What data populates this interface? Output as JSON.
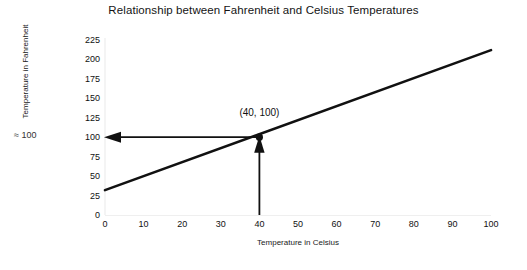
{
  "chart_data": {
    "type": "line",
    "title": "Relationship between Fahrenheit and Celsius Temperatures",
    "xlabel": "Temperature in Celsius",
    "ylabel": "Temperature in Fahrenheit",
    "xlim": [
      0,
      100
    ],
    "ylim": [
      0,
      225
    ],
    "grid": false,
    "legend": false,
    "xticks": [
      "0",
      "10",
      "20",
      "30",
      "40",
      "50",
      "60",
      "70",
      "80",
      "90",
      "100"
    ],
    "xtick_values": [
      0,
      10,
      20,
      30,
      40,
      50,
      60,
      70,
      80,
      90,
      100
    ],
    "yticks": [
      "0",
      "25",
      "50",
      "75",
      "100",
      "125",
      "150",
      "175",
      "200",
      "225"
    ],
    "ytick_values": [
      0,
      25,
      50,
      75,
      100,
      125,
      150,
      175,
      200,
      225
    ],
    "series": [
      {
        "name": "Fahrenheit vs Celsius",
        "x": [
          0,
          100
        ],
        "values": [
          32,
          212
        ],
        "color": "#111111"
      }
    ],
    "annotations": [
      {
        "name": "highlighted-point",
        "label": "(40, 100)",
        "x": 40,
        "y": 100
      },
      {
        "name": "y-axis-approx-note",
        "label": "≈ 100"
      }
    ],
    "arrows": [
      {
        "name": "horizontal-guide-arrow",
        "from_x": 40,
        "from_y": 100,
        "to_x": 0,
        "to_y": 100
      },
      {
        "name": "vertical-guide-arrow",
        "from_x": 40,
        "from_y": 0,
        "to_x": 40,
        "to_y": 100
      }
    ]
  }
}
